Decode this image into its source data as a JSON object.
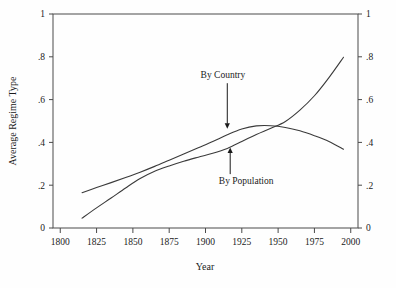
{
  "chart_data": {
    "type": "line",
    "title": "",
    "xlabel": "Year",
    "ylabel": "Average Regime Type",
    "xlim": [
      1795,
      2005
    ],
    "ylim": [
      0,
      1
    ],
    "grid": false,
    "legend_position": "inline-annotations",
    "xticks": [
      1800,
      1825,
      1850,
      1875,
      1900,
      1925,
      1950,
      1975,
      2000
    ],
    "xtick_labels": [
      "1800",
      "1825",
      "1850",
      "1875",
      "1900",
      "1925",
      "1950",
      "1975",
      "2000"
    ],
    "yticks": [
      0,
      0.2,
      0.4,
      0.6,
      0.8,
      1
    ],
    "ytick_labels": [
      "0",
      ".2",
      ".4",
      ".6",
      ".8",
      "1"
    ],
    "right_axis": {
      "visible": true,
      "ticks": [
        0,
        0.2,
        0.4,
        0.6,
        0.8,
        1
      ],
      "tick_labels": [
        "0",
        ".2",
        ".4",
        ".6",
        ".8",
        "1"
      ]
    },
    "series": [
      {
        "name": "By Country",
        "x": [
          1815,
          1825,
          1835,
          1845,
          1855,
          1865,
          1875,
          1885,
          1895,
          1905,
          1915,
          1925,
          1935,
          1945,
          1955,
          1965,
          1975,
          1985,
          1995
        ],
        "values": [
          0.165,
          0.189,
          0.212,
          0.236,
          0.261,
          0.288,
          0.317,
          0.346,
          0.375,
          0.404,
          0.436,
          0.463,
          0.477,
          0.478,
          0.47,
          0.454,
          0.431,
          0.404,
          0.368
        ]
      },
      {
        "name": "By Population",
        "x": [
          1815,
          1825,
          1835,
          1845,
          1855,
          1865,
          1875,
          1885,
          1895,
          1905,
          1915,
          1925,
          1935,
          1945,
          1955,
          1965,
          1975,
          1985,
          1995
        ],
        "values": [
          0.046,
          0.094,
          0.14,
          0.187,
          0.231,
          0.265,
          0.29,
          0.312,
          0.331,
          0.349,
          0.372,
          0.404,
          0.437,
          0.466,
          0.498,
          0.551,
          0.618,
          0.703,
          0.798
        ]
      }
    ],
    "annotations": [
      {
        "text": "By Country",
        "target_x": 1915,
        "target_y": 0.455,
        "label_x": 1912,
        "label_y": 0.7,
        "arrow_direction": "down"
      },
      {
        "text": "By Population",
        "target_x": 1917,
        "target_y": 0.385,
        "label_x": 1928,
        "label_y": 0.205,
        "arrow_direction": "up"
      }
    ]
  },
  "style": {
    "background": "#fefefe",
    "axis_color": "#4a4a4a",
    "line_color": "#3a3a3a",
    "text_color": "#1a1a1a"
  }
}
